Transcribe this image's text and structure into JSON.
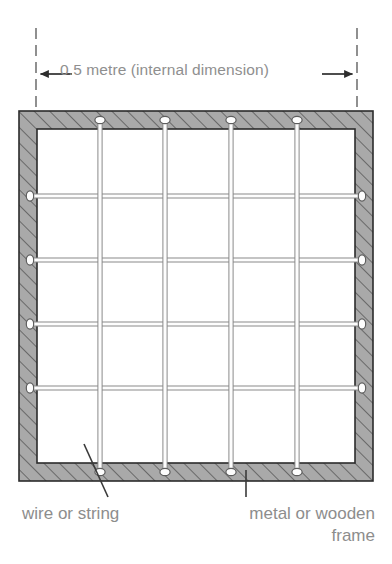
{
  "diagram": {
    "dimension": {
      "label": "0.5 metre (internal dimension)",
      "left_arrow_icon": "arrow-left-icon",
      "right_arrow_icon": "arrow-right-icon",
      "extension_line_style": "dashed"
    },
    "callouts": [
      {
        "id": "wire-or-string",
        "line1": "wire or string",
        "line2": "",
        "align": "left",
        "leader": "diagonal"
      },
      {
        "id": "metal-or-wooden-frame",
        "line1": "metal or wooden",
        "line2": "frame",
        "align": "right",
        "leader": "vertical"
      }
    ],
    "frame": {
      "material_label": "metal or wooden frame",
      "outer": {
        "x": 19,
        "y": 111,
        "width": 354,
        "height": 370
      },
      "inner": {
        "x": 37,
        "y": 129,
        "width": 318,
        "height": 334
      },
      "fill_color": "#a9a9a9",
      "hatch_color": "#4a4a4a",
      "edge_color": "#2b2b2b",
      "hatch_angle_deg": 45
    },
    "grid": {
      "description": "wire or string grid forming 5 by 5 cells",
      "vertical_count": 4,
      "horizontal_count": 4,
      "cells_across": 5,
      "cells_down": 5,
      "vertical_x": [
        100,
        165,
        231,
        297
      ],
      "horizontal_y": [
        196,
        260,
        324,
        388
      ],
      "wire_color": "#fdfdfd",
      "wire_edge_color": "#8a8a8a",
      "wire_width": 5.0,
      "nail_head_color": "#fdfdfd",
      "nail_head_edge_color": "#5d5d5d",
      "nail_head_rx": 5.0,
      "nail_head_ry": 3.6
    },
    "colors": {
      "text": "#8d8d8d",
      "dimension_text": "#8f8f8f",
      "arrow": "#2d2d2d",
      "leader_line": "#3a3a3a",
      "extension_line": "#555555",
      "background": "#ffffff"
    },
    "dim_geometry": {
      "left_x": 36,
      "right_x": 357,
      "ext_top": 28,
      "ext_bottom": 108,
      "arrow_y": 74,
      "arrow_left_tip": 39,
      "arrow_left_tail": 72,
      "arrow_right_tip": 354,
      "arrow_right_tail": 322
    },
    "leaders": {
      "wire": {
        "x1": 108,
        "y1": 497,
        "x2": 84,
        "y2": 444
      },
      "frame": {
        "x1": 246,
        "y1": 497,
        "x2": 246,
        "y2": 470
      }
    }
  }
}
